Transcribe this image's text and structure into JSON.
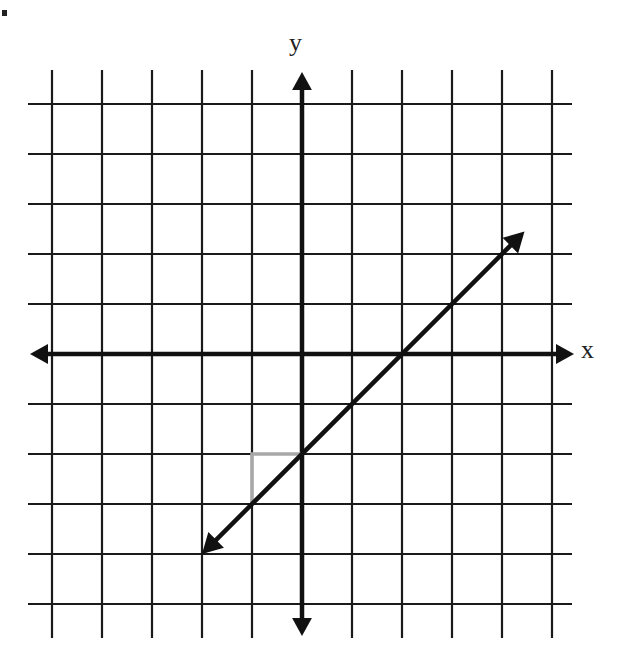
{
  "labels": {
    "x_axis": "x",
    "y_axis": "y"
  },
  "colors": {
    "grid": "#1a1a1a",
    "axis": "#111111",
    "line": "#111111",
    "slope_triangle": "#a8a8a8",
    "background": "#ffffff"
  },
  "chart_data": {
    "type": "line",
    "title": "",
    "xlabel": "x",
    "ylabel": "y",
    "grid": true,
    "xlim": [
      -5.4,
      5.4
    ],
    "ylim": [
      -5.6,
      5.2
    ],
    "x_ticks": [
      -5,
      -4,
      -3,
      -2,
      -1,
      0,
      1,
      2,
      3,
      4,
      5
    ],
    "y_ticks": [
      -5,
      -4,
      -3,
      -2,
      -1,
      0,
      1,
      2,
      3,
      4,
      5
    ],
    "tick_labels_shown": false,
    "series": [
      {
        "name": "line",
        "equation": "y = x - 2",
        "slope": 1,
        "y_intercept": -2,
        "x_intercept": 2,
        "x": [
          -2,
          4.45
        ],
        "y": [
          -4,
          2.45
        ],
        "arrows": "both"
      }
    ],
    "annotations": [
      {
        "type": "slope-triangle",
        "color": "#a8a8a8",
        "points": [
          [
            -1,
            -3
          ],
          [
            -1,
            -2
          ],
          [
            0,
            -2
          ]
        ],
        "rise": 1,
        "run": 1
      }
    ]
  },
  "layout": {
    "origin_px": [
      302,
      354
    ],
    "unit_px": 50,
    "grid_left_px": 28,
    "grid_right_px": 572,
    "grid_top_px": 70,
    "grid_bottom_px": 638
  }
}
